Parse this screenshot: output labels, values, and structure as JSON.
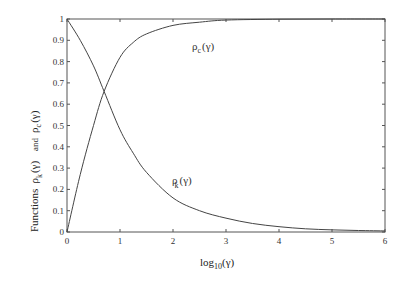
{
  "chart_data": {
    "type": "line",
    "title": "",
    "xlabel": "log10(γ)",
    "ylabel": "Functions ρk(γ) and ρc(γ)",
    "xlim": [
      0,
      6
    ],
    "ylim": [
      0,
      1
    ],
    "grid": false,
    "legend": "none (inline curve labels)",
    "x_ticks": [
      "0",
      "1",
      "2",
      "3",
      "4",
      "5",
      "6"
    ],
    "y_ticks": [
      "0",
      "0.1",
      "0.2",
      "0.3",
      "0.4",
      "0.5",
      "0.6",
      "0.7",
      "0.8",
      "0.9",
      "1"
    ],
    "series": [
      {
        "name": "ρk(γ)",
        "label": "ρk(γ)",
        "x": [
          0,
          0.25,
          0.5,
          0.7,
          1.0,
          1.25,
          1.5,
          2.0,
          2.5,
          3.0,
          3.5,
          4.0,
          4.5,
          5.0,
          5.5,
          6.0
        ],
        "y": [
          1.0,
          0.9,
          0.78,
          0.66,
          0.48,
          0.37,
          0.28,
          0.16,
          0.1,
          0.065,
          0.04,
          0.025,
          0.015,
          0.01,
          0.007,
          0.005
        ]
      },
      {
        "name": "ρc(γ)",
        "label": "ρc(γ)",
        "x": [
          0,
          0.25,
          0.5,
          0.7,
          1.0,
          1.25,
          1.5,
          2.0,
          2.5,
          3.0,
          4.0,
          5.0,
          6.0
        ],
        "y": [
          0.0,
          0.27,
          0.5,
          0.66,
          0.82,
          0.89,
          0.93,
          0.97,
          0.985,
          0.995,
          0.999,
          1.0,
          1.0
        ]
      }
    ],
    "annotations": [
      {
        "text": "ρc(γ)",
        "x": 2.2,
        "y": 0.87
      },
      {
        "text": "ρk(γ)",
        "x": 2.2,
        "y": 0.24
      }
    ]
  },
  "labels": {
    "xlabel_main": "log",
    "xlabel_sub": "10",
    "xlabel_arg": "(γ)",
    "ylabel_functions": "Functions",
    "ylabel_rho": "ρ",
    "ylabel_k": "k",
    "ylabel_c": "c",
    "ylabel_arg": "(γ)",
    "ylabel_and": "and",
    "curve_c_rho": "ρ",
    "curve_c_sub": "c",
    "curve_c_arg": "(γ)",
    "curve_k_rho": "ρ",
    "curve_k_sub": "k",
    "curve_k_arg": "(γ)"
  }
}
